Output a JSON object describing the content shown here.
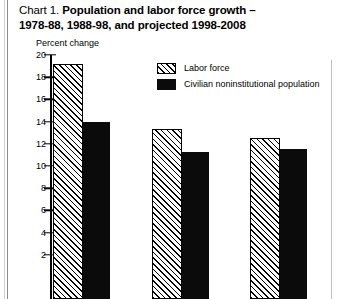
{
  "title": {
    "lead": "Chart 1.",
    "bold_line1": "Population and labor force growth –",
    "bold_line2": "1978-88, 1988-98, and projected 1998-2008"
  },
  "legend": {
    "items": [
      {
        "label": "Labor force",
        "pattern": "hatch"
      },
      {
        "label": "Civilian noninstitutional population",
        "pattern": "solid"
      }
    ]
  },
  "chart_data": {
    "type": "bar",
    "title": "Chart 1. Population and labor force growth – 1978-88, 1988-98, and projected 1998-2008",
    "xlabel": "",
    "ylabel": "Percent change",
    "ylim": [
      0,
      20
    ],
    "yticks": [
      20,
      18,
      16,
      14,
      12,
      10,
      8,
      6,
      4,
      2
    ],
    "ytick_labels": [
      "20",
      "18",
      "16",
      "14",
      "12",
      "10",
      "8",
      "6",
      "4",
      "2"
    ],
    "grid": false,
    "legend_position": "top-center",
    "categories": [
      "1978-88",
      "1988-98",
      "1998-2008"
    ],
    "series": [
      {
        "name": "Labor force",
        "values": [
          19.2,
          13.3,
          12.5
        ]
      },
      {
        "name": "Civilian noninstitutional population",
        "values": [
          14.0,
          11.3,
          11.5
        ]
      }
    ]
  }
}
